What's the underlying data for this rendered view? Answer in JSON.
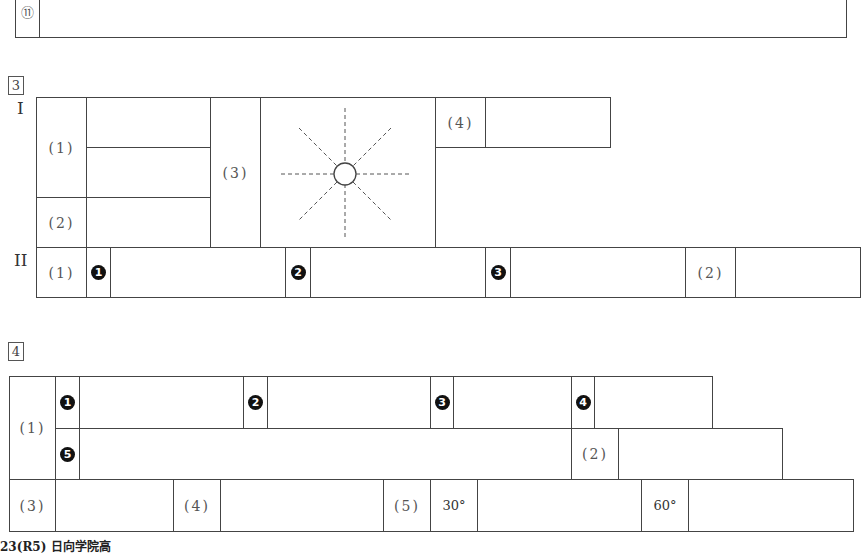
{
  "top_section": {
    "item_label": "⑪"
  },
  "section3": {
    "number": "3",
    "part1": {
      "roman": "I",
      "q1": "(1)",
      "q2": "(2)",
      "q3": "(3)",
      "q4": "(4)",
      "figure_icon": "sun-diagram"
    },
    "part2": {
      "roman": "II",
      "q1": "(1)",
      "sub": [
        "❶",
        "❷",
        "❸"
      ],
      "sub_numbers": [
        "1",
        "2",
        "3"
      ],
      "q2": "(2)"
    }
  },
  "section4": {
    "number": "4",
    "q1": "(1)",
    "q1_sub_numbers": [
      "1",
      "2",
      "3",
      "4",
      "5"
    ],
    "q2": "(2)",
    "q3": "(3)",
    "q4": "(4)",
    "q5": "(5)",
    "angle1": "30°",
    "angle2": "60°"
  },
  "footer": {
    "text": "23(R5) 日向学院高"
  }
}
